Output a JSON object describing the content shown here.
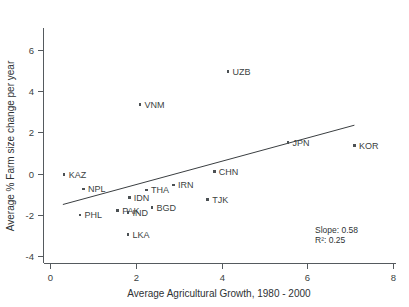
{
  "chart_data": {
    "type": "scatter",
    "title": "",
    "xlabel": "Average Agricultural Growth, 1980 - 2000",
    "ylabel": "Average % Farm size change per year",
    "xlim": [
      0,
      8
    ],
    "ylim": [
      -4,
      6
    ],
    "xticks": [
      0,
      2,
      4,
      6,
      8
    ],
    "yticks": [
      -4,
      -2,
      0,
      2,
      4,
      6
    ],
    "xtick_labels": [
      "0",
      "2",
      "4",
      "6",
      "8"
    ],
    "ytick_labels": [
      "-4",
      "-2",
      "0",
      "2",
      "4",
      "6"
    ],
    "grid": false,
    "legend": "none",
    "marker_color": "#4c5154",
    "line_color": "#3a3e41",
    "points": [
      {
        "label": "UZB",
        "x": 4.15,
        "y": 4.95
      },
      {
        "label": "VNM",
        "x": 2.1,
        "y": 3.35
      },
      {
        "label": "JPN",
        "x": 5.55,
        "y": 1.5
      },
      {
        "label": "KOR",
        "x": 7.1,
        "y": 1.35
      },
      {
        "label": "CHN",
        "x": 3.83,
        "y": 0.1
      },
      {
        "label": "KAZ",
        "x": 0.33,
        "y": -0.05
      },
      {
        "label": "IRN",
        "x": 2.88,
        "y": -0.55
      },
      {
        "label": "NPL",
        "x": 0.78,
        "y": -0.75
      },
      {
        "label": "THA",
        "x": 2.25,
        "y": -0.8
      },
      {
        "label": "IDN",
        "x": 1.85,
        "y": -1.15
      },
      {
        "label": "TJK",
        "x": 3.68,
        "y": -1.25
      },
      {
        "label": "BGD",
        "x": 2.38,
        "y": -1.65
      },
      {
        "label": "PAK",
        "x": 1.58,
        "y": -1.8
      },
      {
        "label": "IND",
        "x": 1.82,
        "y": -1.9
      },
      {
        "label": "PHL",
        "x": 0.7,
        "y": -2.0
      },
      {
        "label": "LKA",
        "x": 1.82,
        "y": -2.95
      }
    ],
    "fit_line": {
      "x_start": 0.3,
      "y_start": -1.5,
      "x_end": 7.1,
      "y_end": 2.35
    },
    "annotations": {
      "slope_label": "Slope: 0.58",
      "r2_label": "R²: 0.25"
    }
  }
}
